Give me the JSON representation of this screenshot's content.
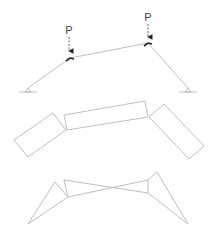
{
  "diagram": {
    "type": "structural-frame-buckling-modes",
    "panels": [
      {
        "name": "loaded-frame",
        "loads": [
          {
            "label": "P",
            "x": 69,
            "label_y": 34,
            "arrow_from": 37,
            "arrow_to": 55
          },
          {
            "label": "P",
            "x": 148,
            "label_y": 21,
            "arrow_from": 24,
            "arrow_to": 41
          }
        ],
        "members": [
          {
            "x1": 28,
            "y1": 88,
            "x2": 70,
            "y2": 58
          },
          {
            "x1": 70,
            "y1": 58,
            "x2": 148,
            "y2": 43
          },
          {
            "x1": 148,
            "y1": 43,
            "x2": 188,
            "y2": 88
          }
        ],
        "supports": [
          {
            "type": "pin",
            "x": 28,
            "y": 88
          },
          {
            "type": "pin",
            "x": 188,
            "y": 88
          }
        ]
      },
      {
        "name": "deformed-blocks",
        "blocks": [
          {
            "points": "14,140 53,113 66,130 28,157"
          },
          {
            "points": "64,115 145,101 148,117 67,130"
          },
          {
            "points": "149,117 164,104 204,146 189,159"
          }
        ]
      },
      {
        "name": "mechanism-mode",
        "polylines": [
          {
            "points": "28,224 55,182 68,197 28,224"
          },
          {
            "points": "64,180 68,197"
          },
          {
            "points": "64,180 148,193"
          },
          {
            "points": "68,197 148,180"
          },
          {
            "points": "148,180 148,193"
          },
          {
            "points": "148,180 157,172 188,224 148,193"
          }
        ]
      }
    ]
  }
}
